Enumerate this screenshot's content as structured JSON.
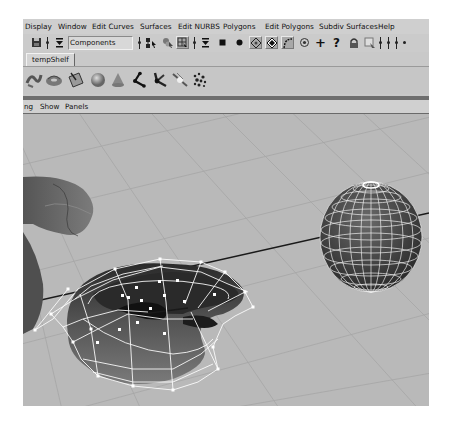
{
  "menubar": {
    "items": [
      "Display",
      "Window",
      "Edit Curves",
      "Surfaces",
      "Edit NURBS",
      "Polygons",
      "Edit Polygons",
      "Subdiv Surfaces",
      "Help"
    ]
  },
  "status_line": {
    "selection_mode_value": "Components",
    "icons": [
      "save-scene-icon",
      "mode-dropdown-icon",
      "select-by-hierarchy-icon",
      "select-by-object-icon",
      "select-by-component-icon",
      "mask-dropdown-icon",
      "point-mask-icon",
      "param-point-mask-icon",
      "line-mask-icon",
      "face-mask-icon",
      "hull-mask-icon",
      "pivot-mask-icon",
      "handle-mask-icon",
      "misc-mask-icon",
      "lock-selection-icon",
      "highlight-selection-icon",
      "snap-icon"
    ]
  },
  "shelf": {
    "active_tab": "tempShelf",
    "tools": [
      "nurbs-curve-tool-icon",
      "nurbs-torus-tool-icon",
      "nurbs-plane-tool-icon",
      "sphere-tool-icon",
      "cone-tool-icon",
      "joint-tool-icon",
      "ik-handle-tool-icon",
      "sculpt-tool-icon",
      "particle-tool-icon"
    ]
  },
  "panel_menu": {
    "items": [
      "ng",
      "Show",
      "Panels"
    ]
  },
  "viewport": {
    "objects": [
      "nurbs-torus-partial",
      "nurbs-torus-selected-with-hull",
      "poly-sphere-selected"
    ],
    "colors": {
      "background": "#b9b9b9",
      "grid": "#a4a4a4",
      "surface_dark": "#3a3a3a",
      "surface_mid": "#6f6f6f",
      "wireframe": "#ffffff",
      "axis_line": "#1a1a1a"
    }
  }
}
